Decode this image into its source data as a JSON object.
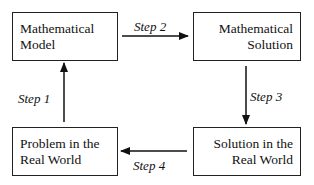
{
  "diagram": {
    "type": "cycle-flowchart",
    "nodes": [
      {
        "id": "model",
        "lines": [
          "Mathematical",
          "Model"
        ]
      },
      {
        "id": "solution",
        "lines": [
          "Mathematical",
          "Solution"
        ]
      },
      {
        "id": "real_solution",
        "lines": [
          "Solution in the",
          "Real World"
        ]
      },
      {
        "id": "problem",
        "lines": [
          "Problem in the",
          "Real World"
        ]
      }
    ],
    "edges": [
      {
        "from": "problem",
        "to": "model",
        "label": "Step 1"
      },
      {
        "from": "model",
        "to": "solution",
        "label": "Step 2"
      },
      {
        "from": "solution",
        "to": "real_solution",
        "label": "Step 3"
      },
      {
        "from": "real_solution",
        "to": "problem",
        "label": "Step 4"
      }
    ]
  }
}
